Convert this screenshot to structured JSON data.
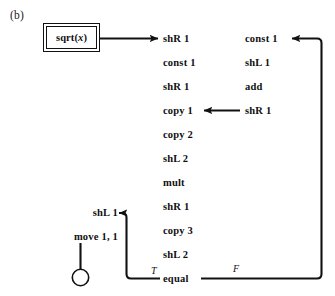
{
  "figure": {
    "panel_label": "(b)",
    "caption_note": ""
  },
  "process_box": {
    "name": "sqrt",
    "argument": "x",
    "label_prefix": "sqrt(",
    "label_suffix": ")"
  },
  "main_column": {
    "items": [
      {
        "label": "shR 1"
      },
      {
        "label": "const 1"
      },
      {
        "label": "shR 1"
      },
      {
        "label": "copy 1"
      },
      {
        "label": "copy 2"
      },
      {
        "label": "shL 2"
      },
      {
        "label": "mult"
      },
      {
        "label": "shR 1"
      },
      {
        "label": "copy 3"
      },
      {
        "label": "shL 2"
      },
      {
        "label": "equal"
      }
    ]
  },
  "right_column": {
    "items": [
      {
        "label": "const 1"
      },
      {
        "label": "shL 1"
      },
      {
        "label": "add"
      },
      {
        "label": "shR 1"
      }
    ]
  },
  "exit_column": {
    "items": [
      {
        "label": "shL 1"
      },
      {
        "label": "move 1, 1"
      }
    ]
  },
  "branch_labels": {
    "true_label": "T",
    "false_label": "F"
  },
  "terminal": {
    "shape": "circle",
    "label": ""
  },
  "colors": {
    "ink": "#111111",
    "background": "#ffffff"
  }
}
